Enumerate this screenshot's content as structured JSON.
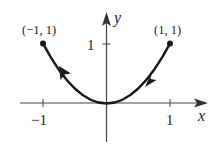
{
  "diagram": {
    "type": "parametric-curve-plot",
    "curve": "y = x^2 on [-1, 1], traced from (1, 1) to (-1, 1)",
    "axes": {
      "x_label": "x",
      "y_label": "y",
      "x_ticks": [
        {
          "value": -1,
          "label": "−1"
        },
        {
          "value": 1,
          "label": "1"
        }
      ],
      "y_ticks": [
        {
          "value": 1,
          "label": "1"
        }
      ]
    },
    "points": [
      {
        "name": "left-endpoint",
        "label": "(−1, 1)",
        "x": -1,
        "y": 1
      },
      {
        "name": "right-endpoint",
        "label": "(1, 1)",
        "x": 1,
        "y": 1
      }
    ],
    "direction": "right-to-left",
    "colors": {
      "curve": "#1a1a1a",
      "axis": "#444444",
      "text": "#222222"
    }
  }
}
